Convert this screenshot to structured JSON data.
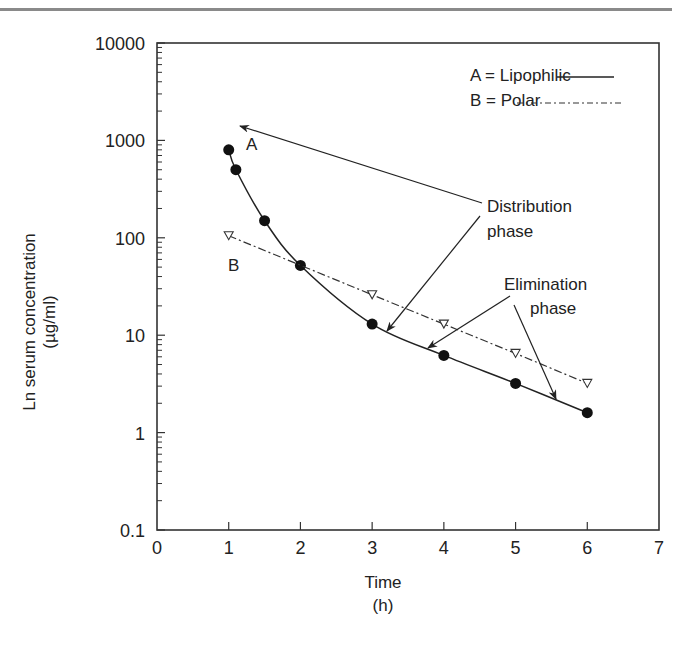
{
  "chart_data": {
    "type": "scatter",
    "title": "",
    "xlabel": "Time",
    "xlabel_unit": "(h)",
    "ylabel": "Ln serum concentration",
    "ylabel_unit": "(µg/ml)",
    "yscale": "log",
    "xlim": [
      0,
      7
    ],
    "ylim": [
      0.1,
      10000
    ],
    "x_ticks": [
      "0",
      "1",
      "2",
      "3",
      "4",
      "5",
      "6",
      "7"
    ],
    "y_ticks": [
      "0.1",
      "1",
      "10",
      "100",
      "1000",
      "10000"
    ],
    "grid": false,
    "legend_position": "upper right",
    "legend": [
      {
        "label": "A = Lipophilic",
        "style": "solid"
      },
      {
        "label": "B = Polar",
        "style": "dash-dot"
      }
    ],
    "series": [
      {
        "name": "A = Lipophilic",
        "marker": "filled-circle",
        "line": "solid",
        "x": [
          1,
          1.1,
          1.5,
          2,
          3,
          4,
          5,
          6
        ],
        "y": [
          800,
          500,
          150,
          52,
          13,
          6.2,
          3.2,
          1.6
        ]
      },
      {
        "name": "B = Polar",
        "marker": "open-triangle-down",
        "line": "dash-dot",
        "x": [
          1,
          3,
          4,
          5,
          6
        ],
        "y": [
          105,
          26,
          13,
          6.5,
          3.2
        ]
      }
    ],
    "annotations": [
      {
        "text": "A",
        "x": 1.3,
        "y": 900
      },
      {
        "text": "B",
        "x": 1.2,
        "y": 60
      },
      {
        "text": "Distribution\nphase"
      },
      {
        "text": "Elimination\nphase"
      }
    ]
  },
  "labels": {
    "xlabel": "Time",
    "xunit": "(h)",
    "ylabel": "Ln serum concentration",
    "yunit": "(µg/ml)",
    "legend_a": "A = Lipophilic",
    "legend_b": "B = Polar",
    "point_a": "A",
    "point_b": "B",
    "dist1": "Distribution",
    "dist2": "phase",
    "elim1": "Elimination",
    "elim2": "phase"
  }
}
